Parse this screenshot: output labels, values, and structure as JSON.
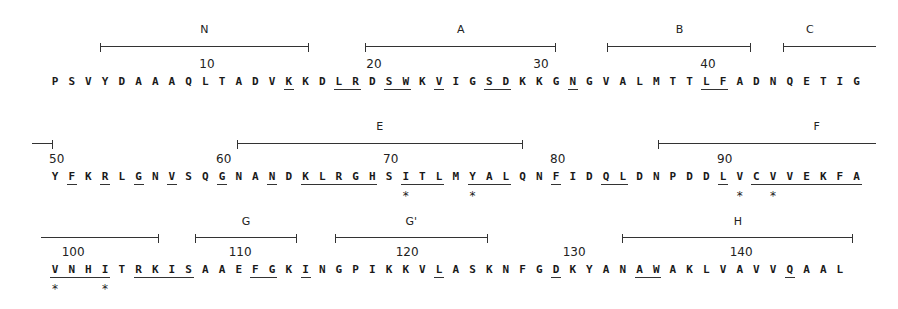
{
  "figure": {
    "type": "protein_sequence_alignment_with_secondary_structure",
    "rows": [
      {
        "start": 1,
        "sequence": "PSVYDAAAQLTADVKKDLRDSWKVIGSDKKGNGVALMTTLFADNQETIG",
        "underlined_positions": [
          15,
          18,
          19,
          21,
          22,
          24,
          27,
          28,
          32,
          40,
          41
        ],
        "starred_positions": [],
        "number_labels": [
          {
            "value": "10",
            "pos": 10
          },
          {
            "value": "20",
            "pos": 20
          },
          {
            "value": "30",
            "pos": 30
          },
          {
            "value": "40",
            "pos": 40
          }
        ],
        "segments": [
          {
            "label": "N",
            "from": 4.1,
            "to": 16.5,
            "left_tick": true,
            "right_tick": true
          },
          {
            "label": "A",
            "from": 20.0,
            "to": 31.3,
            "left_tick": true,
            "right_tick": true
          },
          {
            "label": "B",
            "from": 34.5,
            "to": 43.0,
            "left_tick": true,
            "right_tick": true
          },
          {
            "label": "C",
            "from": 45.0,
            "to": 50.5,
            "left_tick": true,
            "right_tick": false
          }
        ]
      },
      {
        "start": 50,
        "sequence": "YFKRLGNVSQGNANDKLRGHSITLMYALQNFIDQLDNPDDLVCVVEKFA",
        "underlined_positions": [
          51,
          53,
          55,
          57,
          60,
          63,
          65,
          66,
          67,
          68,
          69,
          71,
          72,
          73,
          75,
          76,
          77,
          80,
          83,
          84,
          90,
          92,
          93,
          94,
          95,
          96,
          97,
          98
        ],
        "starred_positions": [
          71,
          75,
          91,
          93
        ],
        "number_labels": [
          {
            "value": "50",
            "pos": 50
          },
          {
            "value": "60",
            "pos": 60
          },
          {
            "value": "70",
            "pos": 70
          },
          {
            "value": "80",
            "pos": 80
          },
          {
            "value": "90",
            "pos": 90
          }
        ],
        "segments": [
          {
            "label": "",
            "from": 49.0,
            "to": 50.2,
            "left_tick": false,
            "right_tick": true
          },
          {
            "label": "E",
            "from": 61.3,
            "to": 78.3,
            "left_tick": true,
            "right_tick": true
          },
          {
            "label": "F",
            "from": 86.5,
            "to": 99.5,
            "left_tick": true,
            "right_tick": false
          }
        ]
      },
      {
        "start": 99,
        "sequence": "VNHITRKISAAEFGKINGPIKKVLASKNFGDKYANAWAKLVAVVQAAL",
        "underlined_positions": [
          99,
          100,
          101,
          102,
          104,
          105,
          106,
          107,
          111,
          112,
          114,
          122,
          129,
          134,
          135,
          143
        ],
        "starred_positions": [
          99,
          102
        ],
        "number_labels": [
          {
            "value": "100",
            "pos": 100
          },
          {
            "value": "110",
            "pos": 110
          },
          {
            "value": "120",
            "pos": 120
          },
          {
            "value": "130",
            "pos": 130
          },
          {
            "value": "140",
            "pos": 140
          }
        ],
        "segments": [
          {
            "label": "",
            "from": 98.5,
            "to": 105.5,
            "left_tick": false,
            "right_tick": true
          },
          {
            "label": "G",
            "from": 107.8,
            "to": 113.8,
            "left_tick": true,
            "right_tick": true
          },
          {
            "label": "G'",
            "from": 116.2,
            "to": 125.2,
            "left_tick": true,
            "right_tick": true
          },
          {
            "label": "H",
            "from": 133.4,
            "to": 147.1,
            "left_tick": true,
            "right_tick": true
          }
        ]
      }
    ]
  }
}
